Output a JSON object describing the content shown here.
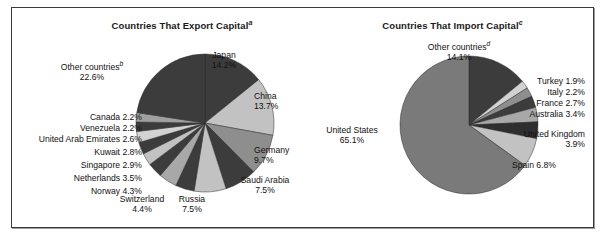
{
  "figure": {
    "background_color": "#ffffff",
    "border_color": "#3a3a3a"
  },
  "charts": [
    {
      "id": "export",
      "title": "Countries That Export Capital",
      "title_superscript": "a"
    },
    {
      "id": "import",
      "title": "Countries That Import Capital",
      "title_superscript": "c"
    }
  ],
  "chart_data": [
    {
      "type": "pie",
      "title": "Countries That Export Capital",
      "title_note": "a",
      "xlabel": "",
      "ylabel": "",
      "units": "percent",
      "legend": "labels placed outside slices",
      "categories": [
        "Japan",
        "China",
        "Germany",
        "Saudi Arabia",
        "Russia",
        "Switzerland",
        "Norway",
        "Netherlands",
        "Singapore",
        "Kuwait",
        "United Arab Emirates",
        "Venezuela",
        "Canada",
        "Other countries"
      ],
      "values": [
        14.2,
        13.7,
        9.7,
        7.5,
        7.5,
        4.4,
        4.3,
        3.5,
        2.9,
        2.8,
        2.6,
        2.2,
        2.2,
        22.6
      ],
      "slices": [
        {
          "label": "Japan",
          "value": 14.2,
          "value_text": "14.2%",
          "note": "",
          "color": "#3c3c3c"
        },
        {
          "label": "China",
          "value": 13.7,
          "value_text": "13.7%",
          "note": "",
          "color": "#c2c2c2"
        },
        {
          "label": "Germany",
          "value": 9.7,
          "value_text": "9.7%",
          "note": "",
          "color": "#8e8e8e"
        },
        {
          "label": "Saudi Arabia",
          "value": 7.5,
          "value_text": "7.5%",
          "note": "",
          "color": "#3c3c3c"
        },
        {
          "label": "Russia",
          "value": 7.5,
          "value_text": "7.5%",
          "note": "",
          "color": "#c2c2c2"
        },
        {
          "label": "Switzerland",
          "value": 4.4,
          "value_text": "4.4%",
          "note": "",
          "color": "#3c3c3c"
        },
        {
          "label": "Norway",
          "value": 4.3,
          "value_text": "4.3%",
          "note": "",
          "color": "#a8a8a8"
        },
        {
          "label": "Netherlands",
          "value": 3.5,
          "value_text": "3.5%",
          "note": "",
          "color": "#3c3c3c"
        },
        {
          "label": "Singapore",
          "value": 2.9,
          "value_text": "2.9%",
          "note": "",
          "color": "#c2c2c2"
        },
        {
          "label": "Kuwait",
          "value": 2.8,
          "value_text": "2.8%",
          "note": "",
          "color": "#3c3c3c"
        },
        {
          "label": "United Arab Emirates",
          "value": 2.6,
          "value_text": "2.6%",
          "note": "",
          "color": "#d2d2d2"
        },
        {
          "label": "Venezuela",
          "value": 2.2,
          "value_text": "2.2%",
          "note": "",
          "color": "#3c3c3c"
        },
        {
          "label": "Canada",
          "value": 2.2,
          "value_text": "2.2%",
          "note": "",
          "color": "#a0a0a0"
        },
        {
          "label": "Other countries",
          "value": 22.6,
          "value_text": "22.6%",
          "note": "b",
          "color": "#3c3c3c"
        }
      ],
      "labels_text": [
        "Japan 14.2%",
        "China 13.7%",
        "Germany 9.7%",
        "Saudi Arabia 7.5%",
        "Russia 7.5%",
        "Switzerland 4.4%",
        "Norway 4.3%",
        "Netherlands 3.5%",
        "Singapore 2.9%",
        "Kuwait 2.8%",
        "United Arab Emirates 2.6%",
        "Venezuela 2.2%",
        "Canada 2.2%",
        "Other countries 22.6%"
      ]
    },
    {
      "type": "pie",
      "title": "Countries That Import Capital",
      "title_note": "c",
      "xlabel": "",
      "ylabel": "",
      "units": "percent",
      "legend": "labels placed outside slices",
      "categories": [
        "United States",
        "Spain",
        "United Kingdom",
        "Australia",
        "France",
        "Italy",
        "Turkey",
        "Other countries"
      ],
      "values": [
        65.1,
        6.8,
        3.9,
        3.4,
        2.7,
        2.2,
        1.9,
        14.1
      ],
      "slices": [
        {
          "label": "Other countries",
          "value": 14.1,
          "value_text": "14.1%",
          "note": "d",
          "color": "#3c3c3c"
        },
        {
          "label": "Turkey",
          "value": 1.9,
          "value_text": "1.9%",
          "note": "",
          "color": "#d2d2d2"
        },
        {
          "label": "Italy",
          "value": 2.2,
          "value_text": "2.2%",
          "note": "",
          "color": "#8e8e8e"
        },
        {
          "label": "France",
          "value": 2.7,
          "value_text": "2.7%",
          "note": "",
          "color": "#3c3c3c"
        },
        {
          "label": "Australia",
          "value": 3.4,
          "value_text": "3.4%",
          "note": "",
          "color": "#a8a8a8"
        },
        {
          "label": "United Kingdom",
          "value": 3.9,
          "value_text": "3.9%",
          "note": "",
          "color": "#2e2e2e"
        },
        {
          "label": "Spain",
          "value": 6.8,
          "value_text": "6.8%",
          "note": "",
          "color": "#c2c2c2"
        },
        {
          "label": "United States",
          "value": 65.1,
          "value_text": "65.1%",
          "note": "",
          "color": "#7a7a7a"
        }
      ],
      "labels_text": [
        "Other countries 14.1%",
        "Turkey 1.9%",
        "Italy 2.2%",
        "France 2.7%",
        "Australia 3.4%",
        "United Kingdom 3.9%",
        "Spain 6.8%",
        "United States 65.1%"
      ]
    }
  ],
  "export_labels": {
    "japan_name": "Japan",
    "japan_value": "14.2%",
    "china_name": "China",
    "china_value": "13.7%",
    "germany_name": "Germany",
    "germany_value": "9.7%",
    "saudi_name": "Saudi Arabia",
    "saudi_value": "7.5%",
    "russia_name": "Russia",
    "russia_value": "7.5%",
    "switzerland_name": "Switzerland",
    "switzerland_value": "4.4%",
    "other_name": "Other countries",
    "other_note": "b",
    "other_value": "22.6%",
    "canada": "Canada 2.2%",
    "venezuela": "Venezuela 2.2%",
    "uae": "United Arab Emirates 2.6%",
    "kuwait": "Kuwait 2.8%",
    "singapore": "Singapore 2.9%",
    "netherlands": "Netherlands 3.5%",
    "norway": "Norway 4.3%"
  },
  "import_labels": {
    "other_name": "Other countries",
    "other_note": "d",
    "other_value": "14.1%",
    "turkey": "Turkey 1.9%",
    "italy": "Italy 2.2%",
    "france": "France 2.7%",
    "australia": "Australia 3.4%",
    "uk_name": "United Kingdom",
    "uk_value": "3.9%",
    "spain": "Spain 6.8%",
    "us_name": "United States",
    "us_value": "65.1%"
  }
}
